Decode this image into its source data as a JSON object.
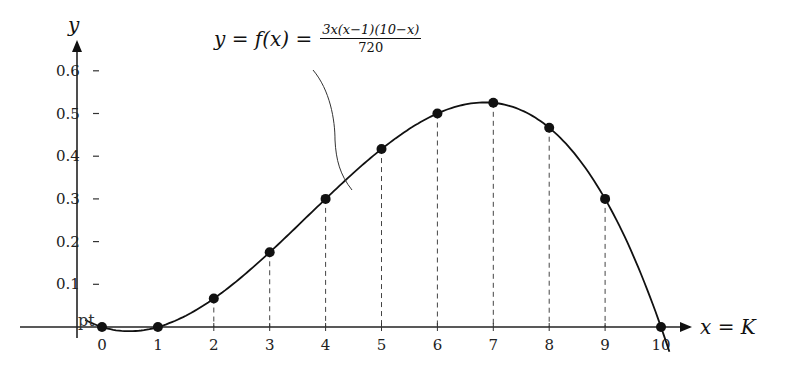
{
  "chart_data": {
    "type": "line",
    "title": "",
    "formula": {
      "lhs": "y = f(x) =",
      "numerator": "3x(x−1)(10−x)",
      "denominator": "720"
    },
    "xlabel": "x = K",
    "ylabel": "y",
    "x_ticks": [
      "0",
      "1",
      "2",
      "3",
      "4",
      "5",
      "6",
      "7",
      "8",
      "9",
      "10"
    ],
    "y_ticks": [
      "0.1",
      "0.2",
      "0.3",
      "0.4",
      "0.5",
      "0.6"
    ],
    "xlim": [
      -0.5,
      10.5
    ],
    "ylim": [
      0,
      0.6
    ],
    "grid": false,
    "series": [
      {
        "name": "f(x)",
        "x": [
          0,
          1,
          2,
          3,
          4,
          5,
          6,
          7,
          8,
          9,
          10
        ],
        "values": [
          0,
          0,
          0.0667,
          0.175,
          0.3,
          0.4167,
          0.5,
          0.525,
          0.4667,
          0.3,
          0
        ],
        "markers": true,
        "dashed_droplines": true
      }
    ],
    "annotations": [
      "pt"
    ]
  }
}
